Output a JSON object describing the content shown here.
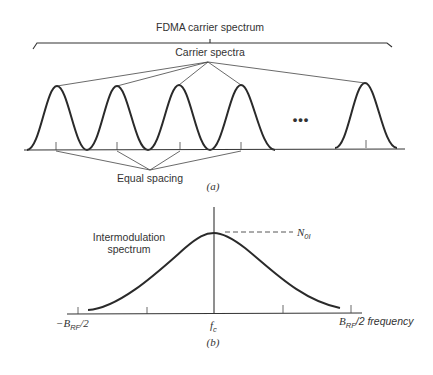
{
  "part_a": {
    "title": "FDMA carrier spectrum",
    "carrier_label": "Carrier spectra",
    "spacing_label": "Equal spacing",
    "ellipsis": "•••",
    "caption": "(a)",
    "carrier_peaks_x": [
      57,
      117,
      179,
      241,
      365
    ]
  },
  "part_b": {
    "spectrum_label_line1": "Intermodulation",
    "spectrum_label_line2": "spectrum",
    "noise_label": "N",
    "noise_sub": "0I",
    "x_left_prefix": "−B",
    "x_left_sub": "RF",
    "x_left_suffix": "/2",
    "x_center": "f",
    "x_center_sub": "c",
    "x_right_prefix": "B",
    "x_right_sub": "RF",
    "x_right_suffix": "/2 frequency",
    "caption": "(b)"
  }
}
